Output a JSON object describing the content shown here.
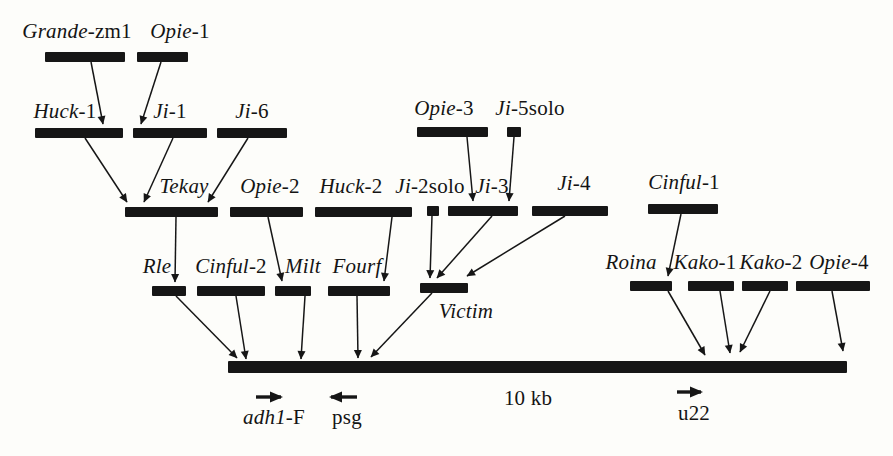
{
  "figure": {
    "background": "#fdfdfa",
    "ink": "#161616",
    "description_semantic": "nested-retrotransposon-insertion-diagram",
    "elements": [
      {
        "id": "grande-zm1",
        "parts": [
          {
            "t": "Grande",
            "i": 1
          },
          {
            "t": "-zm1",
            "i": 0
          }
        ],
        "lx": 77,
        "lt": 20,
        "bar": [
          45,
          52,
          80,
          10
        ]
      },
      {
        "id": "opie-1",
        "parts": [
          {
            "t": "Opie",
            "i": 1
          },
          {
            "t": "-1",
            "i": 0
          }
        ],
        "lx": 180,
        "lt": 20,
        "bar": [
          137,
          52,
          51,
          10
        ]
      },
      {
        "id": "huck-1",
        "parts": [
          {
            "t": "Huck",
            "i": 1
          },
          {
            "t": "-1",
            "i": 0
          }
        ],
        "lx": 65,
        "lt": 100,
        "bar": [
          35,
          128,
          88,
          10
        ]
      },
      {
        "id": "ji-1",
        "parts": [
          {
            "t": "Ji",
            "i": 1
          },
          {
            "t": "-1",
            "i": 0
          }
        ],
        "lx": 170,
        "lt": 100,
        "bar": [
          133,
          128,
          74,
          10
        ]
      },
      {
        "id": "ji-6",
        "parts": [
          {
            "t": "Ji",
            "i": 1
          },
          {
            "t": "-6",
            "i": 0
          }
        ],
        "lx": 252,
        "lt": 100,
        "bar": [
          217,
          128,
          70,
          10
        ]
      },
      {
        "id": "opie-3",
        "parts": [
          {
            "t": "Opie",
            "i": 1
          },
          {
            "t": "-3",
            "i": 0
          }
        ],
        "lx": 444,
        "lt": 97,
        "bar": [
          417,
          127,
          71,
          10
        ]
      },
      {
        "id": "ji-5solo",
        "parts": [
          {
            "t": "Ji",
            "i": 1
          },
          {
            "t": "-5solo",
            "i": 0
          }
        ],
        "lx": 530,
        "lt": 97,
        "bar": [
          507,
          127,
          14,
          10
        ]
      },
      {
        "id": "tekay",
        "parts": [
          {
            "t": "Tekay",
            "i": 1
          }
        ],
        "lx": 184,
        "lt": 175,
        "bar": [
          125,
          207,
          93,
          10
        ]
      },
      {
        "id": "opie-2",
        "parts": [
          {
            "t": "Opie",
            "i": 1
          },
          {
            "t": "-2",
            "i": 0
          }
        ],
        "lx": 270,
        "lt": 175,
        "bar": [
          230,
          207,
          73,
          10
        ]
      },
      {
        "id": "huck-2",
        "parts": [
          {
            "t": "Huck",
            "i": 1
          },
          {
            "t": "-2",
            "i": 0
          }
        ],
        "lx": 351,
        "lt": 175,
        "bar": [
          315,
          207,
          97,
          10
        ]
      },
      {
        "id": "ji-2solo",
        "parts": [
          {
            "t": "Ji",
            "i": 1
          },
          {
            "t": "-2solo",
            "i": 0
          }
        ],
        "lx": 430,
        "lt": 175,
        "bar": [
          427,
          206,
          12,
          10
        ]
      },
      {
        "id": "ji-3",
        "parts": [
          {
            "t": "Ji",
            "i": 1
          },
          {
            "t": "-3",
            "i": 0
          }
        ],
        "lx": 492,
        "lt": 175,
        "bar": [
          448,
          206,
          70,
          10
        ]
      },
      {
        "id": "ji-4",
        "parts": [
          {
            "t": "Ji",
            "i": 1
          },
          {
            "t": "-4",
            "i": 0
          }
        ],
        "lx": 574,
        "lt": 172,
        "bar": [
          532,
          206,
          76,
          10
        ]
      },
      {
        "id": "cinful-1",
        "parts": [
          {
            "t": "Cinful",
            "i": 1
          },
          {
            "t": "-1",
            "i": 0
          }
        ],
        "lx": 684,
        "lt": 171,
        "bar": [
          648,
          204,
          70,
          10
        ]
      },
      {
        "id": "rle",
        "parts": [
          {
            "t": "Rle",
            "i": 1
          }
        ],
        "lx": 157,
        "lt": 255,
        "bar": [
          152,
          286,
          34,
          10
        ]
      },
      {
        "id": "cinful-2",
        "parts": [
          {
            "t": "Cinful",
            "i": 1
          },
          {
            "t": "-2",
            "i": 0
          }
        ],
        "lx": 231,
        "lt": 255,
        "bar": [
          197,
          286,
          68,
          10
        ]
      },
      {
        "id": "milt",
        "parts": [
          {
            "t": "Milt",
            "i": 1
          }
        ],
        "lx": 303,
        "lt": 255,
        "bar": [
          275,
          286,
          36,
          10
        ]
      },
      {
        "id": "fourf",
        "parts": [
          {
            "t": "Fourf",
            "i": 1
          }
        ],
        "lx": 357,
        "lt": 255,
        "bar": [
          328,
          286,
          62,
          10
        ]
      },
      {
        "id": "victim",
        "parts": [
          {
            "t": "Victim",
            "i": 1
          }
        ],
        "lx": 466,
        "lt": 300,
        "bar": [
          420,
          283,
          48,
          10
        ]
      },
      {
        "id": "roina",
        "parts": [
          {
            "t": "Roina",
            "i": 1
          }
        ],
        "lx": 631,
        "lt": 251,
        "bar": [
          630,
          281,
          42,
          10
        ]
      },
      {
        "id": "kako-1",
        "parts": [
          {
            "t": "Kako",
            "i": 1
          },
          {
            "t": "-1",
            "i": 0
          }
        ],
        "lx": 705,
        "lt": 251,
        "bar": [
          688,
          281,
          46,
          10
        ]
      },
      {
        "id": "kako-2",
        "parts": [
          {
            "t": "Kako",
            "i": 1
          },
          {
            "t": "-2",
            "i": 0
          }
        ],
        "lx": 771,
        "lt": 251,
        "bar": [
          742,
          281,
          46,
          10
        ]
      },
      {
        "id": "opie-4",
        "parts": [
          {
            "t": "Opie",
            "i": 1
          },
          {
            "t": "-4",
            "i": 0
          }
        ],
        "lx": 839,
        "lt": 251,
        "bar": [
          796,
          281,
          74,
          10
        ]
      }
    ],
    "insertion_arrows": [
      {
        "from": "grande-zm1",
        "to": "huck-1",
        "x1": 91,
        "y1": 62,
        "x2": 103,
        "y2": 124
      },
      {
        "from": "opie-1",
        "to": "ji-1",
        "x1": 161,
        "y1": 62,
        "x2": 141,
        "y2": 124
      },
      {
        "from": "huck-1",
        "to": "tekay",
        "x1": 85,
        "y1": 138,
        "x2": 127,
        "y2": 202
      },
      {
        "from": "ji-1",
        "to": "tekay",
        "x1": 173,
        "y1": 138,
        "x2": 144,
        "y2": 202
      },
      {
        "from": "ji-6",
        "to": "tekay",
        "x1": 248,
        "y1": 138,
        "x2": 208,
        "y2": 202
      },
      {
        "from": "opie-3",
        "to": "ji-3",
        "x1": 467,
        "y1": 137,
        "x2": 473,
        "y2": 201
      },
      {
        "from": "ji-5solo",
        "to": "ji-3",
        "x1": 514,
        "y1": 137,
        "x2": 509,
        "y2": 201
      },
      {
        "from": "tekay",
        "to": "rle",
        "x1": 176,
        "y1": 217,
        "x2": 175,
        "y2": 282
      },
      {
        "from": "opie-2",
        "to": "milt",
        "x1": 268,
        "y1": 217,
        "x2": 282,
        "y2": 281
      },
      {
        "from": "huck-2",
        "to": "fourf",
        "x1": 392,
        "y1": 217,
        "x2": 384,
        "y2": 281
      },
      {
        "from": "ji-2solo",
        "to": "victim",
        "x1": 432,
        "y1": 216,
        "x2": 430,
        "y2": 278
      },
      {
        "from": "ji-3",
        "to": "victim",
        "x1": 492,
        "y1": 216,
        "x2": 437,
        "y2": 278
      },
      {
        "from": "ji-4",
        "to": "victim",
        "x1": 565,
        "y1": 216,
        "x2": 467,
        "y2": 276
      },
      {
        "from": "cinful-1",
        "to": "roina",
        "x1": 681,
        "y1": 214,
        "x2": 668,
        "y2": 276
      },
      {
        "from": "rle",
        "to": "genomic-bar",
        "x1": 176,
        "y1": 296,
        "x2": 237,
        "y2": 358
      },
      {
        "from": "cinful-2",
        "to": "genomic-bar",
        "x1": 236,
        "y1": 296,
        "x2": 246,
        "y2": 359
      },
      {
        "from": "milt",
        "to": "genomic-bar",
        "x1": 305,
        "y1": 296,
        "x2": 301,
        "y2": 359
      },
      {
        "from": "fourf",
        "to": "genomic-bar",
        "x1": 357,
        "y1": 296,
        "x2": 358,
        "y2": 358
      },
      {
        "from": "victim",
        "to": "genomic-bar",
        "x1": 432,
        "y1": 293,
        "x2": 371,
        "y2": 357
      },
      {
        "from": "roina",
        "to": "genomic-bar",
        "x1": 668,
        "y1": 291,
        "x2": 705,
        "y2": 355
      },
      {
        "from": "kako-1",
        "to": "genomic-bar",
        "x1": 720,
        "y1": 291,
        "x2": 730,
        "y2": 353
      },
      {
        "from": "kako-2",
        "to": "genomic-bar",
        "x1": 770,
        "y1": 291,
        "x2": 740,
        "y2": 352
      },
      {
        "from": "opie-4",
        "to": "genomic-bar",
        "x1": 832,
        "y1": 291,
        "x2": 843,
        "y2": 351
      }
    ],
    "genomic_bar": {
      "x": 228,
      "y": 361,
      "w": 619,
      "h": 12
    },
    "markers": [
      {
        "id": "adh1-f",
        "parts": [
          {
            "t": "adh1",
            "i": 1
          },
          {
            "t": "-F",
            "i": 0
          }
        ],
        "lx": 274,
        "lt": 406,
        "arrow": {
          "x1": 256,
          "y1": 397,
          "x2": 281,
          "y2": 397
        }
      },
      {
        "id": "psg",
        "parts": [
          {
            "t": "psg",
            "i": 0
          }
        ],
        "lx": 347,
        "lt": 406,
        "arrow": {
          "x1": 357,
          "y1": 397,
          "x2": 331,
          "y2": 397
        }
      },
      {
        "id": "u22",
        "parts": [
          {
            "t": "u22",
            "i": 0
          }
        ],
        "lx": 694,
        "lt": 402,
        "arrow": {
          "x1": 677,
          "y1": 392,
          "x2": 701,
          "y2": 392
        }
      },
      {
        "id": "scale-10kb",
        "parts": [
          {
            "t": "10 kb",
            "i": 0
          }
        ],
        "lx": 528,
        "lt": 387,
        "arrow": null
      }
    ]
  }
}
